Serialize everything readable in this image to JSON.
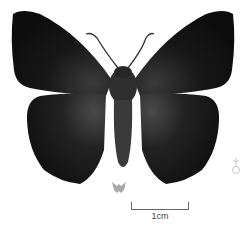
{
  "specimen": {
    "subject": "butterfly specimen, dorsal view",
    "body_color": "#1a1a1a",
    "background": "#ffffff"
  },
  "sex_symbol": {
    "icon": "sex-symbol-icon",
    "color": "#c8c8c8"
  },
  "life_size_icon": {
    "icon": "butterfly-silhouette-icon",
    "color": "#a9a9a9"
  },
  "scale_bar": {
    "label": "1cm"
  }
}
